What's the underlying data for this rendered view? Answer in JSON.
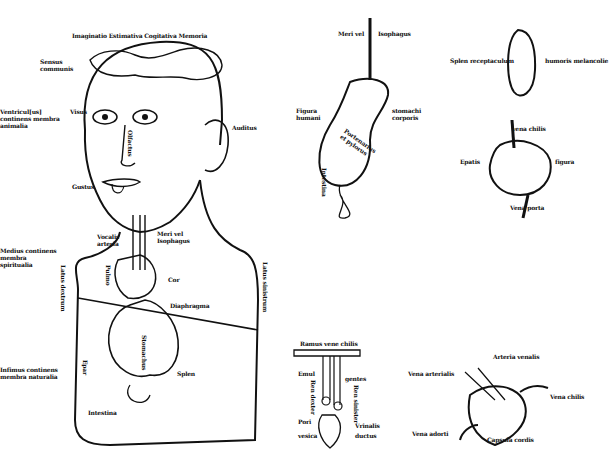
{
  "figure": {
    "main_figure": {
      "labels": {
        "head_top": "Imaginatio Estimativa Cogitativa Memoria",
        "sensus_communis": "Sensus communis",
        "left_face": "Ventricul[us] continens membra animalia",
        "visus": "Visus",
        "olfactus": "Olfactus",
        "auditus": "Auditus",
        "gustus": "Gustus",
        "trachea": "Vocalis arteria",
        "esophagus": "Meri vel Isophagus",
        "medius_venter": "Medius continens membra spiritualia",
        "pulmo": "Pulmo",
        "cor": "Cor",
        "latus_dextrum": "Latus dextrum",
        "latus_sinistrum": "Latus sinistrum",
        "diaphragma": "Diaphragma",
        "infimus_venter": "Infimus continens membra naturalia",
        "epar": "Epar",
        "stomachus": "Stomachus",
        "splen": "Splen",
        "intestina": "Intestina"
      }
    },
    "stomach_diagram": {
      "labels": {
        "top_left": "Meri vel",
        "top_right": "Isophagus",
        "left": "Figura humani",
        "right": "stomachi corporis",
        "body": "Portenarius et pylorus",
        "bottom": "Intestina"
      }
    },
    "spleen_diagram": {
      "labels": {
        "left": "Splen receptaculum",
        "right": "humoris melancolie"
      }
    },
    "liver_diagram": {
      "labels": {
        "top": "vena chilis",
        "left": "Epatis",
        "right": "figura",
        "bottom": "Vena porta"
      }
    },
    "kidney_diagram": {
      "labels": {
        "top": "Ramus vene chilis",
        "emul": "Emul",
        "gentes": "gentes",
        "ren_dexter": "Ren dexter",
        "ren_sinister": "Ren sinister",
        "pori": "Pori",
        "vesica": "vesica",
        "vrinalis": "Vrinalis",
        "ductus": "ductus"
      }
    },
    "heart_diagram": {
      "labels": {
        "arteria_venalis": "Arteria venalis",
        "vena_arterialis": "Vena arterialis",
        "vena_chilis": "Vena chilis",
        "vena_adorti": "Vena adorti",
        "capsula": "Capsula cordis"
      }
    }
  }
}
